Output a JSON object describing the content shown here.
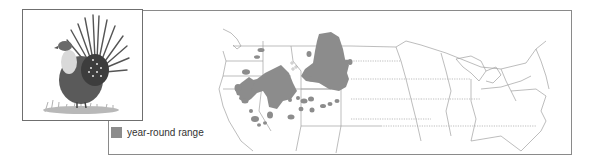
{
  "figure": {
    "type": "species range map",
    "subject_illustration": "sage grouse displaying (strutting male)",
    "region": "United States (western & central focus)"
  },
  "legend": {
    "items": [
      {
        "label": "year-round range",
        "color": "#8c8c8c"
      }
    ]
  },
  "colors": {
    "range_fill": "#8c8c8c",
    "border_line": "#9a9a9a",
    "frame": "#8a8a8a"
  }
}
